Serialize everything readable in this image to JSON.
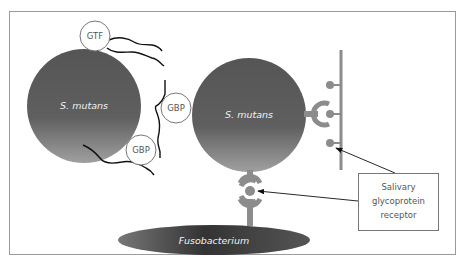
{
  "diagram": {
    "colors": {
      "cell_dark": "#4a4a4a",
      "cell_mid": "#7a7a7a",
      "cell_light": "#a9a9a9",
      "receptor": "#8c8c8c",
      "frame": "#9a9a9a",
      "line": "#111111"
    },
    "cells": [
      {
        "id": "smutans-left",
        "label": "S. mutans"
      },
      {
        "id": "smutans-right",
        "label": "S. mutans"
      },
      {
        "id": "fusobacterium",
        "label": "Fusobacterium"
      }
    ],
    "proteins": [
      {
        "id": "gtf",
        "label": "GTF"
      },
      {
        "id": "gbp-upper",
        "label": "GBP"
      },
      {
        "id": "gbp-lower",
        "label": "GBP"
      }
    ],
    "callout": {
      "lines": [
        "Salivary",
        "glycoprotein",
        "receptor"
      ]
    }
  }
}
